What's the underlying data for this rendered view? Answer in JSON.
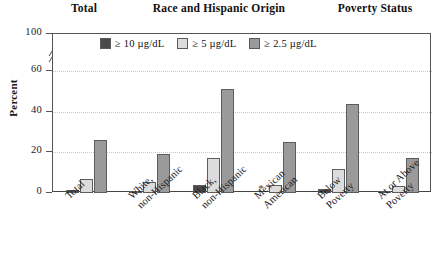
{
  "group_headers": [
    {
      "id": "total",
      "label": "Total"
    },
    {
      "id": "race",
      "label": "Race and Hispanic Origin"
    },
    {
      "id": "poverty",
      "label": "Poverty Status"
    }
  ],
  "legend": {
    "items": [
      {
        "label": "≥ 10 µg/dL",
        "color": "#4a4a4a"
      },
      {
        "label": "≥ 5 µg/dL",
        "color": "#dcdcdc"
      },
      {
        "label": "≥ 2.5 µg/dL",
        "color": "#9a9a9a"
      }
    ]
  },
  "axis": {
    "y_title": "Percent",
    "y_ticks": [
      {
        "label": "100",
        "value": 100
      },
      {
        "label": "60",
        "value": 60
      },
      {
        "label": "40",
        "value": 40
      },
      {
        "label": "20",
        "value": 20
      },
      {
        "label": "0",
        "value": 0
      }
    ],
    "y_break_between": [
      60,
      100
    ],
    "suppressed_marker": "*"
  },
  "chart_data": {
    "type": "bar",
    "title": "",
    "xlabel": "",
    "ylabel": "Percent",
    "ylim": [
      0,
      100
    ],
    "y_axis_break": [
      60,
      100
    ],
    "grid": true,
    "legend_position": "top-inside",
    "categories": [
      "Total",
      "White,\nnon-Hispanic",
      "Black,\nnon-Hispanic",
      "Mexican\nAmerican",
      "Below\nPoverty",
      "At or Above\nPoverty"
    ],
    "group_sections": [
      {
        "label": "Total",
        "categories": [
          "Total"
        ]
      },
      {
        "label": "Race and Hispanic Origin",
        "categories": [
          "White,\nnon-Hispanic",
          "Black,\nnon-Hispanic",
          "Mexican\nAmerican"
        ]
      },
      {
        "label": "Poverty Status",
        "categories": [
          "Below\nPoverty",
          "At or Above\nPoverty"
        ]
      }
    ],
    "series": [
      {
        "name": "≥ 10 µg/dL",
        "color": "#4a4a4a",
        "values": [
          1.6,
          1.1,
          4.0,
          null,
          2.0,
          1.0
        ]
      },
      {
        "name": "≥ 5 µg/dL",
        "color": "#dcdcdc",
        "values": [
          7.0,
          5.5,
          17.0,
          4.0,
          12.0,
          3.5
        ]
      },
      {
        "name": "≥ 2.5 µg/dL",
        "color": "#9a9a9a",
        "values": [
          26.0,
          19.0,
          51.0,
          25.0,
          44.0,
          17.0
        ]
      }
    ],
    "suppressed": [
      {
        "category": "Mexican\nAmerican",
        "series": "≥ 10 µg/dL",
        "marker": "*"
      }
    ]
  }
}
